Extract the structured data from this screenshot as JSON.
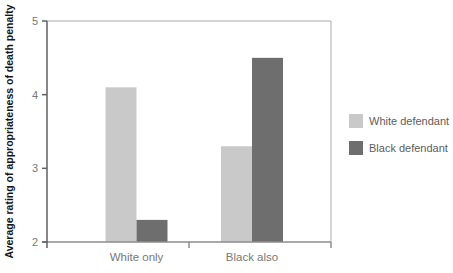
{
  "chart_data": {
    "type": "bar",
    "title": "",
    "xlabel": "",
    "ylabel": "Average rating of appropriateness of death penalty",
    "categories": [
      "White only",
      "Black also"
    ],
    "series": [
      {
        "name": "White defendant",
        "color": "#c9c9c9",
        "values": [
          4.1,
          3.3
        ]
      },
      {
        "name": "Black defendant",
        "color": "#6e6e6e",
        "values": [
          2.3,
          4.5
        ]
      }
    ],
    "ylim": [
      2,
      5
    ],
    "yticks": [
      2,
      3,
      4,
      5
    ],
    "grid": false,
    "legend_position": "right",
    "axis_colors": {
      "y_axis": "#606060",
      "x_axis": "#8c8c8c",
      "frame": "#ababab",
      "tick_label": "#787878",
      "category_label": "#787878"
    }
  }
}
